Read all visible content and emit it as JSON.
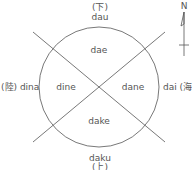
{
  "diagram": {
    "top": {
      "kanji": "(下)",
      "label": "dau"
    },
    "bottom": {
      "label": "daku",
      "kanji": "(上)"
    },
    "left": {
      "label": "(陸) dina"
    },
    "right": {
      "label": "dai (海)"
    },
    "quadrants": {
      "top": "dae",
      "left": "dine",
      "right": "dane",
      "bottom": "dake"
    },
    "compass": {
      "label": "N"
    }
  },
  "colors": {
    "stroke": "#555555",
    "text": "#555555",
    "background": "#ffffff"
  }
}
